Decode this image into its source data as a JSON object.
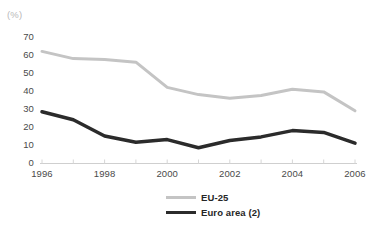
{
  "figure": {
    "unit_label": "(%)",
    "title_remnant": ""
  },
  "legend": {
    "position": "bottom-center",
    "items": [
      {
        "label": "EU-25",
        "color": "#c4c4c4",
        "swatch": "line-swatch-eu25"
      },
      {
        "label": "Euro area (2)",
        "color": "#2b2b2b",
        "swatch": "line-swatch-euro-area"
      }
    ]
  },
  "axes": {
    "y_ticks": [
      "70",
      "60",
      "50",
      "40",
      "30",
      "20",
      "10",
      "0"
    ],
    "x_ticks": [
      "1996",
      "1998",
      "2000",
      "2002",
      "2004",
      "2006"
    ]
  },
  "chart_data": {
    "type": "line",
    "title": "",
    "subtitle": "",
    "xlabel": "",
    "ylabel": "(%)",
    "ylim": [
      0,
      70
    ],
    "xlim": [
      1996,
      2006
    ],
    "grid": false,
    "legend_position": "bottom-center",
    "x": [
      1996,
      1997,
      1998,
      1999,
      2000,
      2001,
      2002,
      2003,
      2004,
      2005,
      2006
    ],
    "x_tick_labels": [
      "1996",
      "1998",
      "2000",
      "2002",
      "2004",
      "2006"
    ],
    "y_tick_labels": [
      "0",
      "10",
      "20",
      "30",
      "40",
      "50",
      "60",
      "70"
    ],
    "y_ticks": [
      0,
      10,
      20,
      30,
      40,
      50,
      60,
      70
    ],
    "annotations": [],
    "series": [
      {
        "name": "EU-25",
        "color": "#c4c4c4",
        "width": 3,
        "values": [
          62,
          58,
          57.5,
          56,
          42,
          38,
          36,
          37.5,
          41,
          39.5,
          29
        ]
      },
      {
        "name": "Euro area (2)",
        "color": "#2b2b2b",
        "width": 3.5,
        "values": [
          28.5,
          24,
          15,
          11.5,
          13,
          8.5,
          12.5,
          14.5,
          18,
          17,
          11
        ]
      }
    ]
  }
}
